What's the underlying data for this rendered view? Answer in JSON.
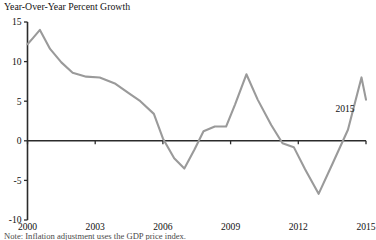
{
  "figure": {
    "title_top_partial": "Figure 2. Real Gross Domestic Product",
    "subtitle": "Year-Over-Year Percent Growth",
    "note_partial": "Note: Inflation adjustment uses the GDP price index."
  },
  "annotations": [
    {
      "name": "endpoint-year-label",
      "text": "2015",
      "x": 345,
      "y": 112
    }
  ],
  "chart_data": {
    "type": "line",
    "title": "Year-Over-Year Percent Growth",
    "xlabel": "",
    "ylabel": "",
    "xlim": [
      2000,
      2015
    ],
    "ylim": [
      -10,
      15
    ],
    "grid": false,
    "legend": "none",
    "line_color": "#9a9a9a",
    "axis_color": "#2b2b2b",
    "yticks": [
      15,
      10,
      5,
      0,
      -5,
      -10
    ],
    "ytick_labels": [
      "15",
      "10",
      "5",
      "0",
      "-5",
      "-10"
    ],
    "xticks": [
      2000,
      2003,
      2006,
      2009,
      2012,
      2015
    ],
    "xtick_labels": [
      "2000",
      "2003",
      "2006",
      "2009",
      "2012",
      "2015"
    ],
    "series": [
      {
        "name": "Real GDP year-over-year percent growth",
        "x": [
          2000.0,
          2000.25,
          2000.55,
          2001.0,
          2001.5,
          2002.0,
          2002.6,
          2003.2,
          2003.9,
          2004.5,
          2005.0,
          2005.6,
          2006.0,
          2006.5,
          2006.95,
          2007.4,
          2007.8,
          2008.3,
          2008.8,
          2009.2,
          2009.7,
          2010.2,
          2010.8,
          2011.3,
          2011.8,
          2012.3,
          2012.9,
          2013.5,
          2014.2,
          2014.8,
          2015.0
        ],
        "y": [
          12.2,
          13.0,
          14.0,
          11.6,
          9.9,
          8.6,
          8.1,
          8.0,
          7.2,
          6.0,
          5.0,
          3.4,
          0.3,
          -2.2,
          -3.5,
          -1.1,
          1.2,
          1.8,
          1.8,
          4.6,
          8.4,
          5.2,
          2.0,
          -0.3,
          -0.8,
          -3.6,
          -6.7,
          -3.0,
          1.4,
          8.0,
          5.2
        ]
      }
    ]
  }
}
